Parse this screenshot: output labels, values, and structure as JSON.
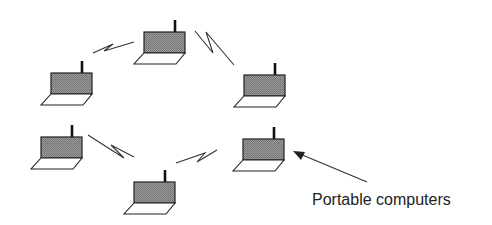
{
  "diagram": {
    "label": "Portable computers",
    "colors": {
      "screen_fill": "#8a8a8a",
      "outline": "#222222",
      "background": "#ffffff"
    },
    "nodes": [
      {
        "id": "laptop-top",
        "icon": "laptop-icon",
        "x": 144,
        "y": 32
      },
      {
        "id": "laptop-left-upper",
        "icon": "laptop-icon",
        "x": 51,
        "y": 73
      },
      {
        "id": "laptop-right-upper",
        "icon": "laptop-icon",
        "x": 244,
        "y": 75
      },
      {
        "id": "laptop-left-lower",
        "icon": "laptop-icon",
        "x": 41,
        "y": 137
      },
      {
        "id": "laptop-right-lower",
        "icon": "laptop-icon",
        "x": 243,
        "y": 139
      },
      {
        "id": "laptop-bottom",
        "icon": "laptop-icon",
        "x": 134,
        "y": 182
      }
    ],
    "links": [
      {
        "from": "laptop-left-upper",
        "to": "laptop-top",
        "icon": "wireless-link-icon"
      },
      {
        "from": "laptop-top",
        "to": "laptop-right-upper",
        "icon": "wireless-link-icon"
      },
      {
        "from": "laptop-left-lower",
        "to": "laptop-bottom",
        "icon": "wireless-link-icon"
      },
      {
        "from": "laptop-bottom",
        "to": "laptop-right-lower",
        "icon": "wireless-link-icon"
      }
    ],
    "annotation": {
      "text": "Portable computers",
      "points_to": "laptop-right-lower",
      "icon": "arrow-icon"
    }
  }
}
